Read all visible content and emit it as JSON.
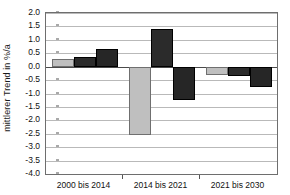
{
  "chart_data": {
    "type": "bar",
    "title": "",
    "subtitle": "",
    "xlabel": "",
    "ylabel": "mittlerer Trend in %/a",
    "categories": [
      "2000 bis 2014",
      "2014 bis 2021",
      "2021 bis 2030"
    ],
    "series": [
      {
        "name": "Reihe 1",
        "color": "#bfbfbf",
        "values": [
          0.28,
          -2.55,
          -0.3
        ]
      },
      {
        "name": "Reihe 2",
        "color": "#2b2b2b",
        "values": [
          0.35,
          1.4,
          -0.35
        ]
      },
      {
        "name": "Reihe 3",
        "color": "#262626",
        "values": [
          0.65,
          -1.25,
          -0.75
        ]
      }
    ],
    "ylim": [
      -4.0,
      2.0
    ],
    "ytick_step": 0.5,
    "ytick_labels": [
      "2.0",
      "1.5",
      "1.0",
      "0.5",
      "0.0",
      "-0.5",
      "-1.0",
      "-1.5",
      "-2.0",
      "-2.5",
      "-3.0",
      "-3.5",
      "-4.0"
    ],
    "ytick_values": [
      2.0,
      1.5,
      1.0,
      0.5,
      0.0,
      -0.5,
      -1.0,
      -1.5,
      -2.0,
      -2.5,
      -3.0,
      -3.5,
      -4.0
    ],
    "grid": true,
    "grid_axis": "y",
    "legend": false,
    "legend_position": "none",
    "annotations": [],
    "plot_background": "#ffffff",
    "grid_color": "#b9b9b9",
    "axis_color": "#6e6e6e",
    "zero_line_color": "#4a4a4a"
  }
}
